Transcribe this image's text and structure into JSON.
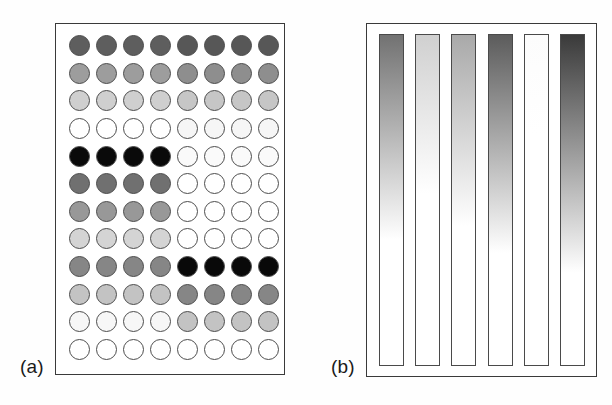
{
  "figure": {
    "background_color": "#ffffff",
    "panels": [
      {
        "id": "a",
        "label": "(a)",
        "type": "dot-matrix",
        "rows": 12,
        "columns": 8
      },
      {
        "id": "b",
        "label": "(b)",
        "type": "gradient-bars",
        "bar_count": 6
      }
    ]
  },
  "chart_data": {
    "type": "heatmap",
    "title": "",
    "xlabel": "",
    "ylabel": "",
    "grid": false,
    "legend": "none",
    "panels": [
      {
        "id": "a",
        "label": "(a)",
        "type": "heatmap",
        "description": "12 by 8 matrix of circular markers filled with discrete gray levels; left four columns and right four columns carry independent intensity sequences",
        "rows": 12,
        "columns": 8,
        "value_scale": "gray level 0 = white (lowest), 1 = black (highest)",
        "row_labels": [
          "1",
          "2",
          "3",
          "4",
          "5",
          "6",
          "7",
          "8",
          "9",
          "10",
          "11",
          "12"
        ],
        "column_labels": [
          "1",
          "2",
          "3",
          "4",
          "5",
          "6",
          "7",
          "8"
        ],
        "marker": "circle",
        "marker_outline_color": "#4d4d4d",
        "values": [
          [
            0.66,
            0.66,
            0.66,
            0.66,
            0.7,
            0.7,
            0.7,
            0.7
          ],
          [
            0.4,
            0.4,
            0.4,
            0.4,
            0.46,
            0.46,
            0.46,
            0.46
          ],
          [
            0.2,
            0.2,
            0.2,
            0.2,
            0.24,
            0.24,
            0.24,
            0.24
          ],
          [
            0.0,
            0.0,
            0.0,
            0.0,
            0.05,
            0.05,
            0.05,
            0.05
          ],
          [
            1.0,
            1.0,
            1.0,
            1.0,
            0.03,
            0.03,
            0.03,
            0.03
          ],
          [
            0.58,
            0.58,
            0.58,
            0.58,
            0.0,
            0.0,
            0.0,
            0.0
          ],
          [
            0.42,
            0.42,
            0.42,
            0.42,
            0.0,
            0.0,
            0.0,
            0.0
          ],
          [
            0.18,
            0.18,
            0.18,
            0.18,
            0.0,
            0.0,
            0.0,
            0.0
          ],
          [
            0.5,
            0.5,
            0.5,
            0.5,
            1.0,
            1.0,
            1.0,
            1.0
          ],
          [
            0.26,
            0.26,
            0.26,
            0.26,
            0.5,
            0.5,
            0.5,
            0.5
          ],
          [
            0.05,
            0.05,
            0.05,
            0.05,
            0.26,
            0.26,
            0.26,
            0.26
          ],
          [
            0.0,
            0.0,
            0.0,
            0.0,
            0.0,
            0.0,
            0.0,
            0.0
          ]
        ],
        "fill_colors": [
          [
            "#5e5e5e",
            "#5e5e5e",
            "#5e5e5e",
            "#5e5e5e",
            "#575757",
            "#575757",
            "#575757",
            "#575757"
          ],
          [
            "#9d9d9d",
            "#9d9d9d",
            "#9d9d9d",
            "#9d9d9d",
            "#8e8e8e",
            "#8e8e8e",
            "#8e8e8e",
            "#8e8e8e"
          ],
          [
            "#cfcfcf",
            "#cfcfcf",
            "#cfcfcf",
            "#cfcfcf",
            "#c6c6c6",
            "#c6c6c6",
            "#c6c6c6",
            "#c6c6c6"
          ],
          [
            "#ffffff",
            "#ffffff",
            "#ffffff",
            "#ffffff",
            "#f6f6f6",
            "#f6f6f6",
            "#f6f6f6",
            "#f6f6f6"
          ],
          [
            "#0a0a0a",
            "#0a0a0a",
            "#0a0a0a",
            "#0a0a0a",
            "#fafafa",
            "#fafafa",
            "#fafafa",
            "#fafafa"
          ],
          [
            "#707070",
            "#707070",
            "#707070",
            "#707070",
            "#ffffff",
            "#ffffff",
            "#ffffff",
            "#ffffff"
          ],
          [
            "#989898",
            "#989898",
            "#989898",
            "#989898",
            "#ffffff",
            "#ffffff",
            "#ffffff",
            "#ffffff"
          ],
          [
            "#d4d4d4",
            "#d4d4d4",
            "#d4d4d4",
            "#d4d4d4",
            "#ffffff",
            "#ffffff",
            "#ffffff",
            "#ffffff"
          ],
          [
            "#868686",
            "#868686",
            "#868686",
            "#868686",
            "#090909",
            "#090909",
            "#090909",
            "#090909"
          ],
          [
            "#c3c3c3",
            "#c3c3c3",
            "#c3c3c3",
            "#c3c3c3",
            "#868686",
            "#868686",
            "#868686",
            "#868686"
          ],
          [
            "#f7f7f7",
            "#f7f7f7",
            "#f7f7f7",
            "#f7f7f7",
            "#c3c3c3",
            "#c3c3c3",
            "#c3c3c3",
            "#c3c3c3"
          ],
          [
            "#ffffff",
            "#ffffff",
            "#ffffff",
            "#ffffff",
            "#ffffff",
            "#ffffff",
            "#ffffff",
            "#ffffff"
          ]
        ]
      },
      {
        "id": "b",
        "label": "(b)",
        "type": "bar",
        "description": "Six vertical bars, each filled with a top-to-bottom gradient from a dark start color fading to white; bar darkness at the top encodes magnitude",
        "categories": [
          "1",
          "2",
          "3",
          "4",
          "5",
          "6"
        ],
        "values": [
          0.55,
          0.22,
          0.38,
          0.68,
          0.02,
          0.86
        ],
        "value_scale": "top-of-bar gray level 0 = white (lowest), 1 = black (highest)",
        "gradient_top_colors": [
          "#727272",
          "#d0d0d0",
          "#a9a9a9",
          "#5c5c5c",
          "#fcfcfc",
          "#3a3a3a"
        ],
        "gradient_bottom_color": "#ffffff",
        "gradient_fade_end_percent": [
          62,
          48,
          58,
          66,
          30,
          72
        ],
        "bar_outline_color": "#4a4a4a"
      }
    ]
  }
}
